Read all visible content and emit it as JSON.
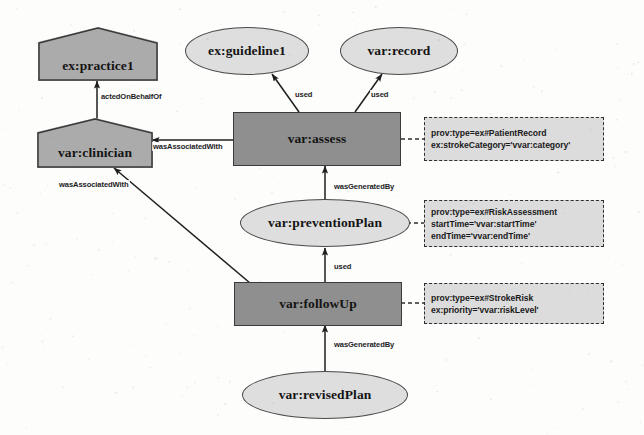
{
  "diagram": {
    "background_color": "#fdfdfc",
    "palette": {
      "entity_fill": "#dedede",
      "activity_fill": "#8f8f8f",
      "agent_fill": "#ababab",
      "annotation_fill": "#dcdcdc",
      "stroke": "#2e2e2e",
      "text": "#141414"
    },
    "nodes": [
      {
        "id": "practice1",
        "label": "ex:practice1",
        "shape": "pentagon",
        "prov_kind": "agent"
      },
      {
        "id": "guideline1",
        "label": "ex:guideline1",
        "shape": "ellipse",
        "prov_kind": "entity"
      },
      {
        "id": "record",
        "label": "var:record",
        "shape": "ellipse",
        "prov_kind": "entity"
      },
      {
        "id": "clinician",
        "label": "var:clinician",
        "shape": "pentagon",
        "prov_kind": "agent"
      },
      {
        "id": "assess",
        "label": "var:assess",
        "shape": "rectangle",
        "prov_kind": "activity"
      },
      {
        "id": "preventionPlan",
        "label": "var:preventionPlan",
        "shape": "ellipse",
        "prov_kind": "entity"
      },
      {
        "id": "followUp",
        "label": "var:followUp",
        "shape": "rectangle",
        "prov_kind": "activity"
      },
      {
        "id": "revisedPlan",
        "label": "var:revisedPlan",
        "shape": "ellipse",
        "prov_kind": "entity"
      }
    ],
    "edges": [
      {
        "id": "e1",
        "from": "clinician",
        "to": "practice1",
        "label": "actedOnBehalfOf"
      },
      {
        "id": "e2",
        "from": "assess",
        "to": "clinician",
        "label": "wasAssociatedWith"
      },
      {
        "id": "e3",
        "from": "followUp",
        "to": "clinician",
        "label": "wasAssociatedWith"
      },
      {
        "id": "e4",
        "from": "assess",
        "to": "guideline1",
        "label": "used"
      },
      {
        "id": "e5",
        "from": "assess",
        "to": "record",
        "label": "used"
      },
      {
        "id": "e6",
        "from": "preventionPlan",
        "to": "assess",
        "label": "wasGeneratedBy"
      },
      {
        "id": "e7",
        "from": "followUp",
        "to": "preventionPlan",
        "label": "used"
      },
      {
        "id": "e8",
        "from": "revisedPlan",
        "to": "followUp",
        "label": "wasGeneratedBy"
      }
    ],
    "annotations": [
      {
        "id": "a1",
        "attached_to": "assess",
        "lines": [
          "prov:type=ex#PatientRecord",
          "ex:strokeCategory='vvar:category'"
        ]
      },
      {
        "id": "a2",
        "attached_to": "preventionPlan",
        "lines": [
          "prov:type=ex#RiskAssessment",
          "startTime='vvar:startTime'",
          "endTime='vvar:endTime'"
        ]
      },
      {
        "id": "a3",
        "attached_to": "followUp",
        "lines": [
          "prov:type=ex#StrokeRisk",
          "ex:priority='vvar:riskLevel'"
        ]
      }
    ],
    "edge_labels": {
      "actedOnBehalfOf": "actedOnBehalfOf",
      "wasAssociatedWith_top": "wasAssociatedWith",
      "wasAssociatedWith_bottom": "wasAssociatedWith",
      "used_guideline": "used",
      "used_record": "used",
      "wasGeneratedBy_plan": "wasGeneratedBy",
      "used_plan": "used",
      "wasGeneratedBy_revised": "wasGeneratedBy"
    }
  }
}
